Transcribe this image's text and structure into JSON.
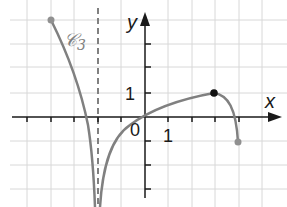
{
  "graph": {
    "curve_label": "𝒞",
    "curve_label_sub": "3",
    "x_axis_label": "x",
    "y_axis_label": "y",
    "origin_label": "0",
    "x_tick_label": "1",
    "y_tick_label": "1",
    "colors": {
      "grid": "#d8d8d8",
      "axis": "#1a1a1a",
      "curve": "#808080",
      "asymptote": "#808080",
      "max_point": "#111111",
      "endpoint": "#909090"
    },
    "asymptote_x": -2,
    "endpoints": [
      {
        "x": -4,
        "y": 4
      },
      {
        "x": 4,
        "y": -1
      }
    ],
    "max_point": {
      "x": 3,
      "y": 1
    }
  }
}
